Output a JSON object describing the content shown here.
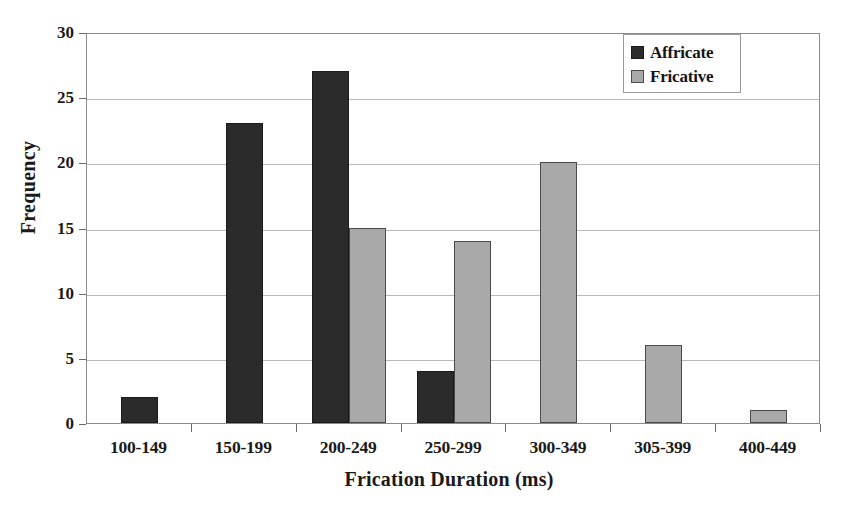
{
  "chart_data": {
    "type": "bar",
    "title": "",
    "xlabel": "Frication Duration (ms)",
    "ylabel": "Frequency",
    "categories": [
      "100-149",
      "150-199",
      "200-249",
      "250-299",
      "300-349",
      "305-399",
      "400-449"
    ],
    "series": [
      {
        "name": "Affricate",
        "color": "#2b2b2b",
        "values": [
          2,
          23,
          27,
          4,
          0,
          0,
          0
        ]
      },
      {
        "name": "Fricative",
        "color": "#a9a9a9",
        "values": [
          0,
          0,
          15,
          14,
          20,
          6,
          1
        ]
      }
    ],
    "ylim": [
      0,
      30
    ],
    "ytick_values": [
      0,
      5,
      10,
      15,
      20,
      25,
      30
    ],
    "ytick_labels": [
      "0",
      "5",
      "10",
      "15",
      "20",
      "25",
      "30"
    ],
    "grid": true,
    "grid_axis": "y",
    "legend_position": "top-right-inside"
  },
  "legend": {
    "entries": [
      {
        "label": "Affricate",
        "swatch": "affricate"
      },
      {
        "label": "Fricative",
        "swatch": "fricative"
      }
    ]
  },
  "axes": {
    "y_title": "Frequency",
    "x_title": "Frication Duration (ms)"
  },
  "colors": {
    "affricate": "#2b2b2b",
    "fricative": "#a9a9a9",
    "gridline": "#b9b9b9",
    "frame": "#8a8a8a",
    "text": "#1a1a1a",
    "background": "#ffffff"
  }
}
